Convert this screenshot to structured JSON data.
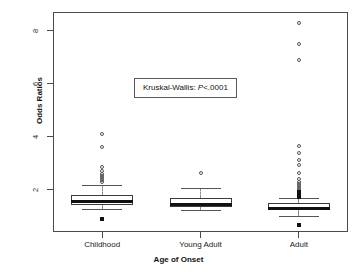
{
  "chart_data": {
    "type": "box",
    "title": "",
    "xlabel": "Age of Onset",
    "ylabel": "Odds Ratios",
    "categories": [
      "Childhood",
      "Young Adult",
      "Adult"
    ],
    "ylim": [
      0.4,
      8.7
    ],
    "yticks": [
      2,
      4,
      6,
      8
    ],
    "ytick_labels": [
      "2",
      "4",
      "6",
      "8"
    ],
    "grid": false,
    "legend": "none",
    "annotations": [
      {
        "name": "kruskal-wallis-test",
        "prefix": "Kruskal-Wallis: ",
        "statistic_symbol": "P",
        "value": "<.0001",
        "full_text": "Kruskal-Wallis: P<.0001"
      }
    ],
    "series": [
      {
        "name": "Childhood",
        "q1": 1.42,
        "median": 1.55,
        "q3": 1.78,
        "whisker_low": 1.25,
        "whisker_high": 2.18,
        "outliers": [
          4.08,
          3.62,
          2.86,
          2.72,
          2.6,
          2.52,
          2.45,
          2.38,
          2.3,
          0.88
        ]
      },
      {
        "name": "Young Adult",
        "q1": 1.33,
        "median": 1.44,
        "q3": 1.68,
        "whisker_low": 1.22,
        "whisker_high": 2.05,
        "outliers": [
          2.63
        ]
      },
      {
        "name": "Adult",
        "q1": 1.22,
        "median": 1.3,
        "q3": 1.5,
        "whisker_low": 1.02,
        "whisker_high": 1.7,
        "outliers": [
          8.3,
          7.48,
          6.88,
          3.66,
          3.38,
          3.1,
          2.92,
          2.62,
          2.4,
          2.28,
          2.2,
          2.12,
          2.05,
          1.98,
          1.92,
          1.86,
          1.8,
          1.76,
          1.73,
          0.65
        ]
      }
    ]
  },
  "axis": {
    "y_label": "Odds Ratios",
    "x_label": "Age of Onset",
    "y_tick_0": "2",
    "y_tick_1": "4",
    "y_tick_2": "6",
    "y_tick_3": "8",
    "x_tick_0": "Childhood",
    "x_tick_1": "Young Adult",
    "x_tick_2": "Adult"
  },
  "annotation": {
    "prefix": "Kruskal-Wallis: ",
    "symbol": "P",
    "value": "<.0001"
  },
  "colors": {
    "frame": "#4a4a4a",
    "box_border": "#3a3a3a",
    "median": "#111111",
    "whisker": "#8a8a8a",
    "outlier": "#555555",
    "background": "#ffffff"
  }
}
